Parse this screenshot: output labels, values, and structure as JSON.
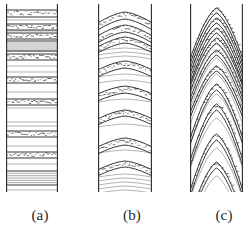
{
  "figure": {
    "type": "line-drawing",
    "background_color": "#ffffff",
    "stroke_color": "#2b2b2b",
    "panel_count": 3
  },
  "panels": [
    {
      "id": "a",
      "caption": "(a)",
      "bedding_style": "horizontal-planar",
      "curvature": 0.0,
      "column_x": 6,
      "column_y": 4,
      "column_width": 52,
      "column_height": 188,
      "bands": [
        {
          "y": 6,
          "thickness": 7,
          "fill": "stippled"
        },
        {
          "y": 20,
          "thickness": 6,
          "fill": "stippled"
        },
        {
          "y": 29,
          "thickness": 6,
          "fill": "stippled"
        },
        {
          "y": 37,
          "thickness": 10,
          "fill": "laminated"
        },
        {
          "y": 50,
          "thickness": 6,
          "fill": "stippled"
        },
        {
          "y": 73,
          "thickness": 6,
          "fill": "stippled"
        },
        {
          "y": 95,
          "thickness": 6,
          "fill": "stippled"
        },
        {
          "y": 127,
          "thickness": 6,
          "fill": "stippled"
        },
        {
          "y": 148,
          "thickness": 6,
          "fill": "stippled"
        },
        {
          "y": 167,
          "thickness": 14,
          "fill": "laminated"
        }
      ],
      "hairlines": [
        16,
        27,
        47,
        62,
        68,
        88,
        104,
        118,
        122,
        142,
        160,
        186
      ]
    },
    {
      "id": "b",
      "caption": "(b)",
      "bedding_style": "gently-arched",
      "curvature": 0.35,
      "column_x": 98,
      "column_y": 4,
      "column_width": 54,
      "column_height": 188,
      "bands": [
        {
          "y": 8,
          "thickness": 7,
          "fill": "stippled",
          "arch": 11
        },
        {
          "y": 21,
          "thickness": 7,
          "fill": "stippled",
          "arch": 11
        },
        {
          "y": 33,
          "thickness": 6,
          "fill": "stippled",
          "arch": 10
        },
        {
          "y": 57,
          "thickness": 7,
          "fill": "stippled",
          "arch": 9
        },
        {
          "y": 82,
          "thickness": 7,
          "fill": "stippled",
          "arch": 8
        },
        {
          "y": 106,
          "thickness": 6,
          "fill": "stippled",
          "arch": 9
        },
        {
          "y": 134,
          "thickness": 7,
          "fill": "stippled",
          "arch": 9
        },
        {
          "y": 157,
          "thickness": 6,
          "fill": "stippled",
          "arch": 9
        }
      ],
      "hairlines": [
        44,
        48,
        52,
        70,
        76,
        95,
        120,
        146,
        170,
        174,
        178,
        182,
        186
      ]
    },
    {
      "id": "c",
      "caption": "(c)",
      "bedding_style": "strongly-arched-conical",
      "curvature": 1.0,
      "column_x": 190,
      "column_y": 4,
      "column_width": 53,
      "column_height": 188,
      "bands": [
        {
          "y": 4,
          "thickness": 5,
          "fill": "stippled",
          "arch": 52
        },
        {
          "y": 14,
          "thickness": 5,
          "fill": "stippled",
          "arch": 52
        },
        {
          "y": 24,
          "thickness": 5,
          "fill": "stippled",
          "arch": 52
        },
        {
          "y": 34,
          "thickness": 5,
          "fill": "stippled",
          "arch": 50
        },
        {
          "y": 46,
          "thickness": 5,
          "fill": "stippled",
          "arch": 50
        },
        {
          "y": 62,
          "thickness": 5,
          "fill": "stippled",
          "arch": 48
        },
        {
          "y": 80,
          "thickness": 6,
          "fill": "stippled",
          "arch": 56
        },
        {
          "y": 100,
          "thickness": 6,
          "fill": "stippled",
          "arch": 58
        },
        {
          "y": 130,
          "thickness": 6,
          "fill": "stippled",
          "arch": 58
        },
        {
          "y": 158,
          "thickness": 6,
          "fill": "stippled",
          "arch": 56
        }
      ],
      "hairlines": [
        9,
        19,
        29,
        40,
        54,
        70,
        90,
        114,
        144,
        172
      ]
    }
  ],
  "captions": {
    "a": "(a)",
    "b": "(b)",
    "c": "(c)"
  }
}
